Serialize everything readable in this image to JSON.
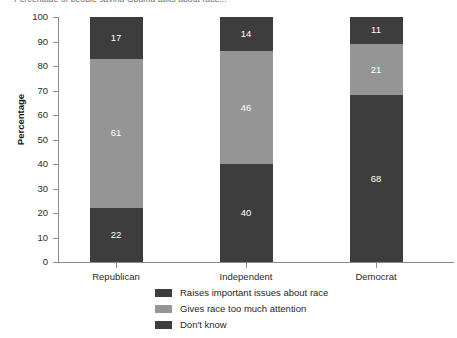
{
  "chart_data": {
    "type": "bar",
    "subtype": "stacked-vertical",
    "title": "Percentage of people saying Obama talks about race...",
    "xlabel": "",
    "ylabel": "Percentage",
    "ylim": [
      0,
      100
    ],
    "ytick_step": 10,
    "yticks": [
      100,
      90,
      80,
      70,
      60,
      50,
      40,
      30,
      20,
      10,
      0
    ],
    "categories": [
      "Republican",
      "Independent",
      "Democrat"
    ],
    "grid": false,
    "legend_position": "bottom-center",
    "series": [
      {
        "name": "Raises important issues about race",
        "color": "#3d3d3d",
        "values": [
          22,
          40,
          68
        ]
      },
      {
        "name": "Gives race too much attention",
        "color": "#959595",
        "values": [
          61,
          46,
          21
        ]
      },
      {
        "name": "Don't know",
        "color": "#3d3d3d",
        "values": [
          17,
          14,
          11
        ]
      }
    ],
    "stack_order_bottom_to_top": [
      0,
      1,
      2
    ],
    "axis_color": "#8c8c8c",
    "value_label_color": "#ffffff",
    "background": "#ffffff"
  }
}
